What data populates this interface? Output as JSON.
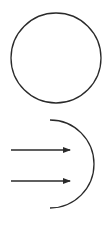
{
  "diagram": {
    "elements": [
      {
        "kind": "circle",
        "label": ""
      },
      {
        "kind": "arc",
        "label": ""
      },
      {
        "kind": "arrow",
        "label": ""
      },
      {
        "kind": "arrow",
        "label": ""
      }
    ],
    "stroke_color": "#2a2a2a",
    "background_color": "#ffffff"
  }
}
